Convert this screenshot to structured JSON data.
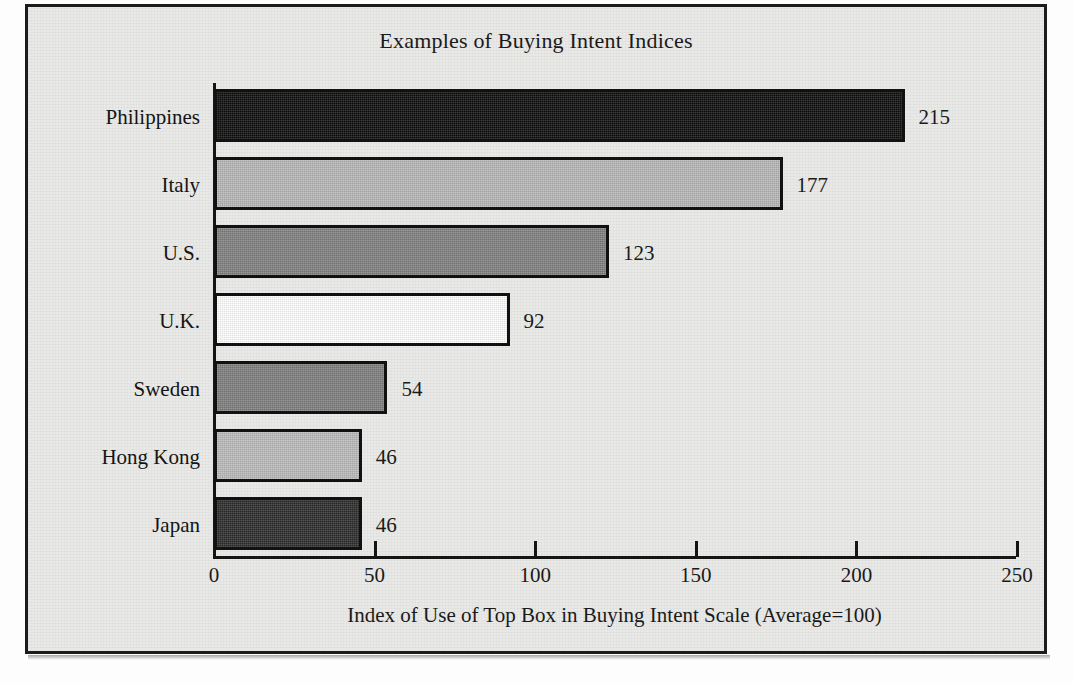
{
  "chart_data": {
    "type": "bar",
    "orientation": "horizontal",
    "title": "Examples of Buying Intent Indices",
    "xlabel": "Index of Use of Top Box in Buying Intent Scale (Average=100)",
    "ylabel": "",
    "xlim": [
      0,
      250
    ],
    "grid": false,
    "legend": "none",
    "xticks": [
      "0",
      "50",
      "100",
      "150",
      "200",
      "250"
    ],
    "xtick_values": [
      0,
      50,
      100,
      150,
      200,
      250
    ],
    "categories": [
      "Philippines",
      "Italy",
      "U.S.",
      "U.K.",
      "Sweden",
      "Hong Kong",
      "Japan"
    ],
    "values": [
      215,
      177,
      123,
      92,
      54,
      46,
      46
    ],
    "value_labels": [
      "215",
      "177",
      "123",
      "92",
      "54",
      "46",
      "46"
    ],
    "bar_colors": [
      "#0d0d0d",
      "#b6b6b6",
      "#7f7f7f",
      "#ffffff",
      "#7d7d7d",
      "#bababa",
      "#2b2b2b"
    ],
    "bar_edge_color": "#111111",
    "background_color": "#e9e9e7",
    "axis_color": "#151515",
    "bars": [
      {
        "category": "Philippines",
        "value": 215,
        "label": "215",
        "color": "#0d0d0d"
      },
      {
        "category": "Italy",
        "value": 177,
        "label": "177",
        "color": "#b6b6b6"
      },
      {
        "category": "U.S.",
        "value": 123,
        "label": "123",
        "color": "#7f7f7f"
      },
      {
        "category": "U.K.",
        "value": 92,
        "label": "92",
        "color": "#ffffff"
      },
      {
        "category": "Sweden",
        "value": 54,
        "label": "54",
        "color": "#7d7d7d"
      },
      {
        "category": "Hong Kong",
        "value": 46,
        "label": "46",
        "color": "#bababa"
      },
      {
        "category": "Japan",
        "value": 46,
        "label": "46",
        "color": "#2b2b2b"
      }
    ]
  }
}
